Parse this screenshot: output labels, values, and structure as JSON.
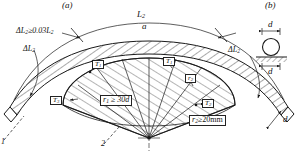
{
  "figure": {
    "type": "engineering-drawing",
    "style": "monochrome line art, hatched sections",
    "panels": [
      {
        "id": "a",
        "label": "(a)",
        "caption": "bent bar elevation"
      },
      {
        "id": "b",
        "label": "(b)",
        "caption": "bar cross-section on support"
      }
    ],
    "colors": {
      "line": "#1a1a1a",
      "background": "#ffffff",
      "hatch": "#2a2a2a"
    }
  },
  "panel_a": {
    "tag": "(a)",
    "arc_label": "L",
    "arc_label_sub": "2",
    "chord_label": "a",
    "delta_left_full": "ΔL",
    "delta_left_full_sub": "2",
    "delta_left_rel": "≥0.03L",
    "delta_left_rel_sub": "2",
    "delta_left_short": "ΔL",
    "delta_left_short_sub": "2",
    "delta_right": "ΔL",
    "delta_right_sub": "2",
    "callout_1": "1",
    "callout_2": "2",
    "tags": [
      {
        "name": "T",
        "sub": "1",
        "x": 92,
        "y": 60
      },
      {
        "name": "T",
        "sub": "1",
        "x": 163,
        "y": 57
      },
      {
        "name": "r",
        "sub": "2",
        "x": 185,
        "y": 74
      },
      {
        "name": "T",
        "sub": "3",
        "x": 50,
        "y": 96
      },
      {
        "name": "T",
        "sub": "2",
        "x": 202,
        "y": 99
      }
    ],
    "radius_note_1": {
      "symbol": "r",
      "sub": "1",
      "relation": "≥",
      "value": "30d"
    },
    "radius_note_2": {
      "symbol": "r",
      "sub": "2",
      "relation": "≥",
      "value": "20mm"
    }
  },
  "panel_b": {
    "tag": "(b)",
    "dim_top": "d",
    "dim_bottom": "d",
    "dim_bar": "d"
  }
}
